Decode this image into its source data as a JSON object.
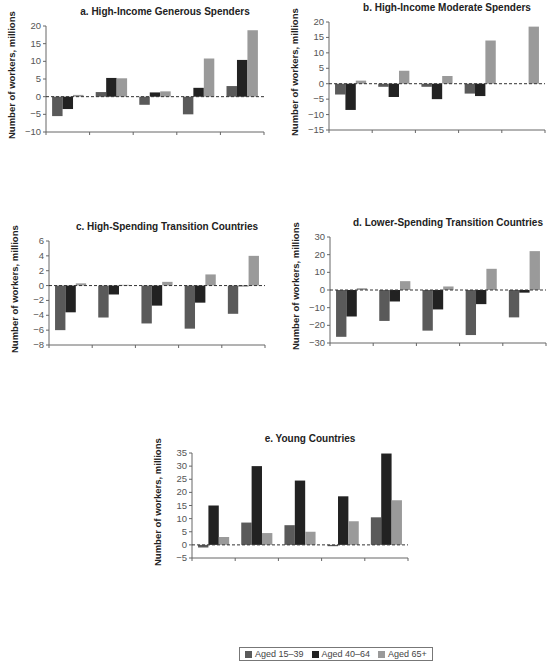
{
  "colors": {
    "aged_15_39": "#5a5a5a",
    "aged_40_64": "#222222",
    "aged_65_plus": "#9a9a9a",
    "axis": "#555555"
  },
  "legend": [
    {
      "label": "Aged 15–39",
      "key": "aged_15_39"
    },
    {
      "label": "Aged 40–64",
      "key": "aged_40_64"
    },
    {
      "label": "Aged 65+",
      "key": "aged_65_plus"
    }
  ],
  "chart_data": [
    {
      "type": "bar",
      "title": "a. High-Income Generous Spenders",
      "ylabel": "Number of workers, millions",
      "categories": [
        "Constant participation rates",
        "Convergence to benchmark countries",
        "Female to male convergence",
        "Increase in work life by 10 years",
        "Combined maximum scenario"
      ],
      "ylim": [
        -10,
        20
      ],
      "yticks": [
        20,
        15,
        10,
        5,
        0,
        -5,
        -10
      ],
      "series": [
        {
          "name": "Aged 15–39",
          "values": [
            -5.5,
            1.3,
            -2.3,
            -5.0,
            3.0
          ]
        },
        {
          "name": "Aged 40–64",
          "values": [
            -3.5,
            5.3,
            1.2,
            2.5,
            10.4
          ]
        },
        {
          "name": "Aged 65+",
          "values": [
            0.5,
            5.2,
            1.5,
            10.8,
            18.8
          ]
        }
      ],
      "box": {
        "left": 46,
        "top": 26,
        "width": 218,
        "height": 106
      }
    },
    {
      "type": "bar",
      "title": "b. High-Income Moderate Spenders",
      "ylabel": "Number of workers, millions",
      "categories": [
        "Constant participation rates",
        "Convergence to benchmark countries",
        "Female to male convergence",
        "Increase in work life by 10 years",
        "Combined maximum scenario"
      ],
      "ylim": [
        -15,
        20
      ],
      "yticks": [
        20,
        15,
        10,
        5,
        0,
        -5,
        -10,
        -15
      ],
      "series": [
        {
          "name": "Aged 15–39",
          "values": [
            -3.5,
            -1.0,
            -1.0,
            -3.2,
            0.0
          ]
        },
        {
          "name": "Aged 40–64",
          "values": [
            -8.5,
            -4.3,
            -5.0,
            -4.0,
            0.0
          ]
        },
        {
          "name": "Aged 65+",
          "values": [
            1.0,
            4.2,
            2.5,
            14.0,
            18.5
          ]
        }
      ],
      "box": {
        "left": 329,
        "top": 22,
        "width": 216,
        "height": 108
      }
    },
    {
      "type": "bar",
      "title": "c. High-Spending Transition Countries",
      "ylabel": "Number of workers, millions",
      "categories": [
        "Constant participation rates",
        "Convergence to benchmark countries",
        "Female to male convergence",
        "Increase in work life by 10 years",
        "Combined maximum scenario"
      ],
      "ylim": [
        -8,
        6
      ],
      "yticks": [
        6,
        4,
        2,
        0,
        -2,
        -4,
        -6,
        -8
      ],
      "series": [
        {
          "name": "Aged 15–39",
          "values": [
            -6.0,
            -4.3,
            -5.1,
            -5.8,
            -3.8
          ]
        },
        {
          "name": "Aged 40–64",
          "values": [
            -3.6,
            -1.2,
            -2.7,
            -2.3,
            -0.1
          ]
        },
        {
          "name": "Aged 65+",
          "values": [
            0.3,
            0.1,
            0.5,
            1.5,
            4.0
          ]
        }
      ],
      "box": {
        "left": 49,
        "top": 241,
        "width": 216,
        "height": 104
      }
    },
    {
      "type": "bar",
      "title": "d. Lower-Spending Transition Countries",
      "ylabel": "Number of workers, millions",
      "categories": [
        "Constant participation rates",
        "Convergence to benchmark countries",
        "Female to male convergence",
        "Increase in work life by 10 years",
        "Combined maximum scenario"
      ],
      "ylim": [
        -30,
        30
      ],
      "yticks": [
        30,
        20,
        10,
        0,
        -10,
        -20,
        -30
      ],
      "series": [
        {
          "name": "Aged 15–39",
          "values": [
            -26.5,
            -17.5,
            -23.0,
            -25.5,
            -15.5
          ]
        },
        {
          "name": "Aged 40–64",
          "values": [
            -15.0,
            -6.5,
            -11.0,
            -8.0,
            -1.5
          ]
        },
        {
          "name": "Aged 65+",
          "values": [
            1.0,
            5.0,
            2.0,
            12.0,
            22.0
          ]
        }
      ],
      "box": {
        "left": 330,
        "top": 237,
        "width": 216,
        "height": 106
      }
    },
    {
      "type": "bar",
      "title": "e. Young Countries",
      "ylabel": "Number of workers, millions",
      "categories": [
        "Constant participation rates",
        "Convergence to benchmark countries",
        "Female to male convergence",
        "Increase in work life by 10 years",
        "Combined maximum scenario"
      ],
      "ylim": [
        -5,
        35
      ],
      "yticks": [
        35,
        30,
        25,
        20,
        15,
        10,
        5,
        0,
        -5
      ],
      "series": [
        {
          "name": "Aged 15–39",
          "values": [
            -1.0,
            8.5,
            7.5,
            -0.5,
            10.5
          ]
        },
        {
          "name": "Aged 40–64",
          "values": [
            15.0,
            30.0,
            24.5,
            18.5,
            34.8
          ]
        },
        {
          "name": "Aged 65+",
          "values": [
            3.0,
            4.5,
            5.0,
            9.0,
            17.0
          ]
        }
      ],
      "box": {
        "left": 192,
        "top": 453,
        "width": 216,
        "height": 105
      }
    }
  ]
}
